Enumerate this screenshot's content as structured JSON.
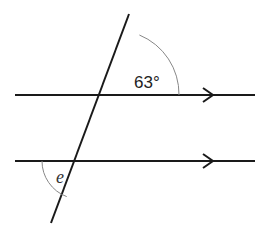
{
  "diagram": {
    "colors": {
      "line": "#1a1a1a",
      "arc": "#888888",
      "text": "#222222",
      "background": "#ffffff"
    },
    "lines": {
      "parallel_top": {
        "x1": 15,
        "y1": 95,
        "x2": 255,
        "y2": 95,
        "arrow_x": 213
      },
      "parallel_bottom": {
        "x1": 15,
        "y1": 161,
        "x2": 255,
        "y2": 161,
        "arrow_x": 213
      },
      "transversal": {
        "x1": 129,
        "y1": 14,
        "x2": 51,
        "y2": 223
      }
    },
    "angles": {
      "top_angle": {
        "label": "63°",
        "value_deg": 63,
        "position": "upper-right of top intersection"
      },
      "bottom_angle": {
        "label": "e",
        "position": "lower-left of bottom intersection"
      }
    }
  }
}
